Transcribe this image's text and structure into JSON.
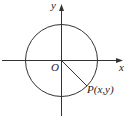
{
  "diagram": {
    "labels": {
      "x_axis": "x",
      "y_axis": "y",
      "origin": "O",
      "point": "P(x,y)"
    },
    "elements": {
      "axes": [
        "x-axis (horizontal, arrow to right)",
        "y-axis (vertical, arrow upward)"
      ],
      "circle": "circle centered at origin O",
      "segment": "radius from O to P in fourth quadrant",
      "point": "P on circle at approximately -45 degrees"
    },
    "colors": {
      "stroke": "#333333",
      "background": "#ffffff"
    }
  }
}
